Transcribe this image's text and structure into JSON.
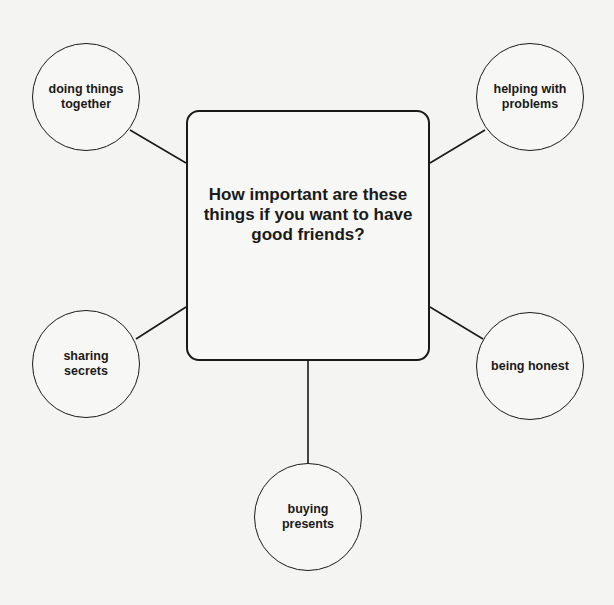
{
  "diagram": {
    "central_question": "How important are these things if you want to have good friends?",
    "nodes": [
      {
        "id": "doing-things-together",
        "label": "doing things together"
      },
      {
        "id": "helping-with-problems",
        "label": "helping with problems"
      },
      {
        "id": "sharing-secrets",
        "label": "sharing secrets"
      },
      {
        "id": "being-honest",
        "label": "being honest"
      },
      {
        "id": "buying-presents",
        "label": "buying presents"
      }
    ],
    "colors": {
      "line": "#1a1a1a",
      "background": "#f4f4f2"
    }
  }
}
